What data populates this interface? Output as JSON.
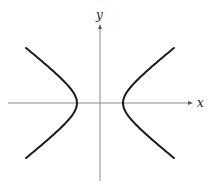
{
  "diagram": {
    "type": "hyperbola-graph",
    "axes": {
      "x_label": "x",
      "y_label": "y",
      "origin_px": [
        100,
        103
      ],
      "x_axis_px": [
        8,
        193
      ],
      "y_axis_px": [
        25,
        181
      ],
      "axis_color": "#8a8a8a"
    },
    "curve": {
      "equation": "x^2/a^2 - y^2/b^2 = 1",
      "a_px": 23,
      "b_px": 18,
      "y_extent_px": 55,
      "stroke": "#1a1a1a",
      "stroke_width": 2
    }
  }
}
